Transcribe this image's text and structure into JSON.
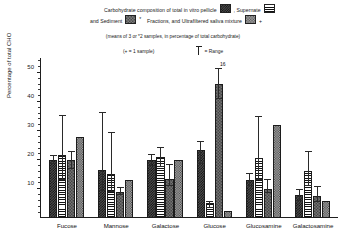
{
  "legend": {
    "line1_pre": "Carbohydrate composition of total in vitro pellicle",
    "line1_mid": ",  Supernate",
    "line2_pre": "and Sediment",
    "line2_mid": "Fractions, and Ultrafiltered saliva mixture",
    "asterisk": "*",
    "plus": "+",
    "swatch_pellicle": "checker-swatch-icon",
    "swatch_supernate": "horizontal-lines-swatch-icon",
    "swatch_sediment": "fine-checker-swatch-icon",
    "swatch_ultrafiltered": "dotted-swatch-icon"
  },
  "subtitle": "(means of 3 or *2 samples, in percentage of total carbohydrate)",
  "notes": {
    "sample_note": "(+ = 1 sample)",
    "range_note": "= Range",
    "range_glyph": "error-bar-icon"
  },
  "chart_data": {
    "type": "bar",
    "subtitle": "(means of 3 or *2 samples, in percentage of total carbohydrate)",
    "xlabel": "",
    "ylabel": "Percentage of total CHO",
    "ylim": [
      0,
      55
    ],
    "yticks": [
      10,
      20,
      30,
      40,
      50
    ],
    "ytick_labels": [
      "10",
      "20",
      "30",
      "40",
      "50"
    ],
    "minor_tick_step": 2,
    "grid": false,
    "legend_position": "top",
    "categories": [
      "Fucose",
      "Mannose",
      "Galactose",
      "Glucose",
      "Glucosamine",
      "Galactosamine"
    ],
    "series": [
      {
        "name": "Total in vitro pellicle",
        "pattern": "checker",
        "values": [
          20.0,
          16.5,
          20.0,
          23.5,
          13.0,
          7.8
        ],
        "err_low": [
          18.8,
          9.5,
          18.0,
          18.5,
          11.0,
          6.0
        ],
        "err_high": [
          21.5,
          36.5,
          22.0,
          26.5,
          15.5,
          10.0
        ]
      },
      {
        "name": "Supernate fraction",
        "pattern": "horizontal-lines",
        "values": [
          21.5,
          15.0,
          21.0,
          5.0,
          20.5,
          16.0
        ],
        "err_low": [
          13.0,
          9.0,
          17.5,
          3.5,
          13.0,
          11.0
        ],
        "err_high": [
          35.5,
          29.5,
          24.5,
          6.0,
          35.0,
          23.0
        ]
      },
      {
        "name": "Sediment fraction",
        "pattern": "fine-checker",
        "values": [
          20.0,
          9.0,
          13.5,
          46.0,
          10.0,
          7.5
        ],
        "err_low": [
          17.0,
          8.0,
          11.0,
          41.0,
          8.5,
          5.5
        ],
        "err_high": [
          23.0,
          10.5,
          18.5,
          51.5,
          13.5,
          11.0
        ],
        "notes": [
          "",
          "",
          "",
          "16",
          "",
          ""
        ]
      },
      {
        "name": "Ultrafiltered saliva mixture",
        "pattern": "dots",
        "values": [
          28.0,
          13.0,
          20.0,
          2.5,
          32.0,
          6.0
        ],
        "err_low": [
          null,
          null,
          null,
          null,
          null,
          null
        ],
        "err_high": [
          null,
          null,
          null,
          null,
          null,
          null
        ]
      }
    ]
  }
}
